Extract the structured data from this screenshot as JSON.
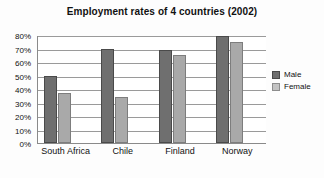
{
  "chart_data": {
    "type": "bar",
    "title": "Employment rates of 4 countries (2002)",
    "xlabel": "",
    "ylabel": "",
    "categories": [
      "South Africa",
      "Chile",
      "Finland",
      "Norway"
    ],
    "series": [
      {
        "name": "Male",
        "color": "#6f6f6f",
        "values": [
          50,
          70,
          69,
          79
        ]
      },
      {
        "name": "Female",
        "color": "#a9a9a9",
        "values": [
          37,
          34,
          65,
          75
        ]
      }
    ],
    "ylim": [
      0,
      80
    ],
    "ytick_step": 10,
    "ytick_labels": [
      "0%",
      "10%",
      "20%",
      "30%",
      "40%",
      "50%",
      "60%",
      "70%",
      "80%"
    ],
    "grid": true,
    "legend_position": "right",
    "value_suffix": "%"
  }
}
